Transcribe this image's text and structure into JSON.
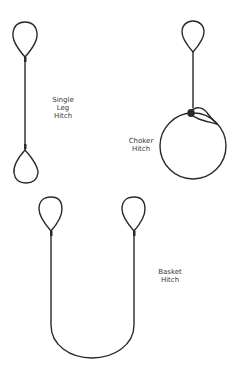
{
  "diagram": {
    "labels": {
      "single_leg": [
        "Single",
        "Leg",
        "Hitch"
      ],
      "choker": [
        "Choker",
        "Hitch"
      ],
      "basket": [
        "Basket",
        "Hitch"
      ]
    },
    "colors": {
      "line": "#2a2a2a",
      "text": "#3a3a3a",
      "background": "#ffffff"
    }
  }
}
